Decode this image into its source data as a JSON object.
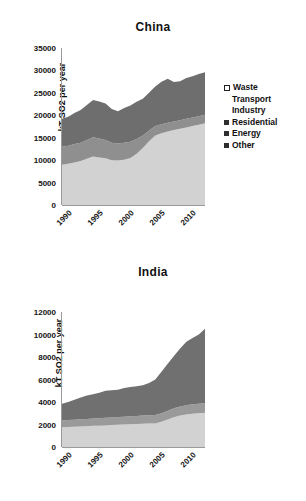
{
  "charts": [
    {
      "id": "china",
      "title": "China",
      "ylabel": "kT SO2 per year",
      "yticks": [
        "0",
        "5000",
        "10000",
        "15000",
        "20000",
        "25000",
        "30000",
        "35000"
      ],
      "xticks": [
        "1990",
        "1995",
        "2000",
        "2005",
        "2010"
      ],
      "legend": [
        {
          "label": "Waste",
          "marker": "hollow-square",
          "color": "#ffffff"
        },
        {
          "label": "Transport",
          "marker": "none",
          "color": "#ffffff"
        },
        {
          "label": "Industry",
          "marker": "none",
          "color": "#ffffff"
        },
        {
          "label": "Residential",
          "marker": "filled-square",
          "color": "#2e2e2e"
        },
        {
          "label": "Energy",
          "marker": "filled-square",
          "color": "#2e2e2e"
        },
        {
          "label": "Other",
          "marker": "filled-square",
          "color": "#2e2e2e"
        }
      ]
    },
    {
      "id": "india",
      "title": "India",
      "ylabel": "kT SO2 per year",
      "yticks": [
        "0",
        "2000",
        "4000",
        "6000",
        "8000",
        "10000",
        "12000"
      ],
      "xticks": [
        "1990",
        "1995",
        "2000",
        "2005",
        "2010"
      ],
      "legend": [
        {
          "label": "Waste",
          "marker": "hollow-square",
          "color": "#ffffff"
        },
        {
          "label": "Transport",
          "marker": "none",
          "color": "#ffffff"
        },
        {
          "label": "Industry",
          "marker": "none",
          "color": "#ffffff"
        },
        {
          "label": "Residential",
          "marker": "filled-square",
          "color": "#2e2e2e"
        },
        {
          "label": "Energy",
          "marker": "filled-square",
          "color": "#2e2e2e"
        },
        {
          "label": "Other",
          "marker": "filled-square",
          "color": "#2e2e2e"
        }
      ]
    }
  ],
  "chart_data": [
    {
      "type": "area",
      "stacked": true,
      "title": "China",
      "xlabel": "",
      "ylabel": "kT SO2 per year",
      "xlim": [
        1990,
        2013
      ],
      "ylim": [
        0,
        35000
      ],
      "ytick_step": 5000,
      "grid": false,
      "legend_position": "right",
      "x": [
        1990,
        1991,
        1992,
        1993,
        1994,
        1995,
        1996,
        1997,
        1998,
        1999,
        2000,
        2001,
        2002,
        2003,
        2004,
        2005,
        2006,
        2007,
        2008,
        2009,
        2010,
        2011,
        2012,
        2013
      ],
      "series": [
        {
          "name": "Other",
          "color": "#d2d2d2",
          "values": [
            9000,
            9200,
            9500,
            9800,
            10300,
            10800,
            10600,
            10400,
            10000,
            9900,
            10100,
            10500,
            11400,
            12700,
            14200,
            15500,
            16000,
            16400,
            16700,
            17000,
            17300,
            17600,
            17900,
            18200
          ]
        },
        {
          "name": "Energy",
          "color": "#8f8f8f",
          "values": [
            4000,
            4000,
            4100,
            4100,
            4200,
            4300,
            4200,
            4100,
            3900,
            3800,
            3800,
            3600,
            3300,
            2800,
            2400,
            2100,
            2000,
            1950,
            1900,
            1900,
            1900,
            1900,
            1900,
            1900
          ]
        },
        {
          "name": "Residential",
          "color": "#6e6e6e",
          "values": [
            6200,
            6500,
            6900,
            7300,
            7800,
            8300,
            8300,
            8100,
            7500,
            7200,
            7700,
            8100,
            8300,
            8200,
            8400,
            8800,
            9500,
            9800,
            8800,
            8700,
            9100,
            9200,
            9400,
            9500
          ]
        },
        {
          "name": "Industry",
          "color": "#ffffff",
          "values": [
            0,
            0,
            0,
            0,
            0,
            0,
            0,
            0,
            0,
            0,
            0,
            0,
            0,
            0,
            0,
            0,
            0,
            0,
            0,
            0,
            0,
            0,
            0,
            0
          ]
        },
        {
          "name": "Transport",
          "color": "#ffffff",
          "values": [
            0,
            0,
            0,
            0,
            0,
            0,
            0,
            0,
            0,
            0,
            0,
            0,
            0,
            0,
            0,
            0,
            0,
            0,
            0,
            0,
            0,
            0,
            0,
            0
          ]
        },
        {
          "name": "Waste",
          "color": "#ffffff",
          "values": [
            0,
            0,
            0,
            0,
            0,
            0,
            0,
            0,
            0,
            0,
            0,
            0,
            0,
            0,
            0,
            0,
            0,
            0,
            0,
            0,
            0,
            0,
            0,
            0
          ]
        }
      ],
      "totals": [
        19200,
        19700,
        20500,
        21200,
        22300,
        23400,
        23100,
        22600,
        21400,
        20900,
        21600,
        22200,
        23000,
        23700,
        25000,
        26400,
        27500,
        28150,
        27400,
        27600,
        28300,
        28700,
        29200,
        29600
      ]
    },
    {
      "type": "area",
      "stacked": true,
      "title": "India",
      "xlabel": "",
      "ylabel": "kT SO2 per year",
      "xlim": [
        1990,
        2013
      ],
      "ylim": [
        0,
        12000
      ],
      "ytick_step": 2000,
      "grid": false,
      "legend_position": "right",
      "x": [
        1990,
        1991,
        1992,
        1993,
        1994,
        1995,
        1996,
        1997,
        1998,
        1999,
        2000,
        2001,
        2002,
        2003,
        2004,
        2005,
        2006,
        2007,
        2008,
        2009,
        2010,
        2011,
        2012,
        2013
      ],
      "series": [
        {
          "name": "Other",
          "color": "#d2d2d2",
          "values": [
            1750,
            1780,
            1800,
            1830,
            1850,
            1880,
            1900,
            1920,
            1950,
            1970,
            2000,
            2020,
            2040,
            2060,
            2080,
            2100,
            2250,
            2450,
            2650,
            2800,
            2900,
            2950,
            3000,
            3050
          ]
        },
        {
          "name": "Energy",
          "color": "#9a9a9a",
          "values": [
            600,
            610,
            620,
            630,
            640,
            650,
            660,
            670,
            680,
            690,
            700,
            710,
            720,
            730,
            740,
            750,
            760,
            770,
            790,
            800,
            820,
            840,
            850,
            860
          ]
        },
        {
          "name": "Residential",
          "color": "#707070",
          "values": [
            1500,
            1610,
            1780,
            1940,
            2080,
            2170,
            2270,
            2410,
            2420,
            2440,
            2540,
            2600,
            2640,
            2710,
            2880,
            3150,
            3690,
            4180,
            4660,
            5160,
            5630,
            5910,
            6150,
            6600
          ]
        },
        {
          "name": "Industry",
          "color": "#ffffff",
          "values": [
            0,
            0,
            0,
            0,
            0,
            0,
            0,
            0,
            0,
            0,
            0,
            0,
            0,
            0,
            0,
            0,
            0,
            0,
            0,
            0,
            0,
            0,
            0,
            0
          ]
        },
        {
          "name": "Transport",
          "color": "#ffffff",
          "values": [
            0,
            0,
            0,
            0,
            0,
            0,
            0,
            0,
            0,
            0,
            0,
            0,
            0,
            0,
            0,
            0,
            0,
            0,
            0,
            0,
            0,
            0,
            0,
            0
          ]
        },
        {
          "name": "Waste",
          "color": "#ffffff",
          "values": [
            0,
            0,
            0,
            0,
            0,
            0,
            0,
            0,
            0,
            0,
            0,
            0,
            0,
            0,
            0,
            0,
            0,
            0,
            0,
            0,
            0,
            0,
            0,
            0
          ]
        }
      ],
      "totals": [
        3850,
        4000,
        4200,
        4400,
        4570,
        4700,
        4830,
        5000,
        5050,
        5100,
        5240,
        5330,
        5400,
        5500,
        5700,
        6000,
        6700,
        7400,
        8100,
        8760,
        9350,
        9700,
        10000,
        10510
      ]
    }
  ]
}
